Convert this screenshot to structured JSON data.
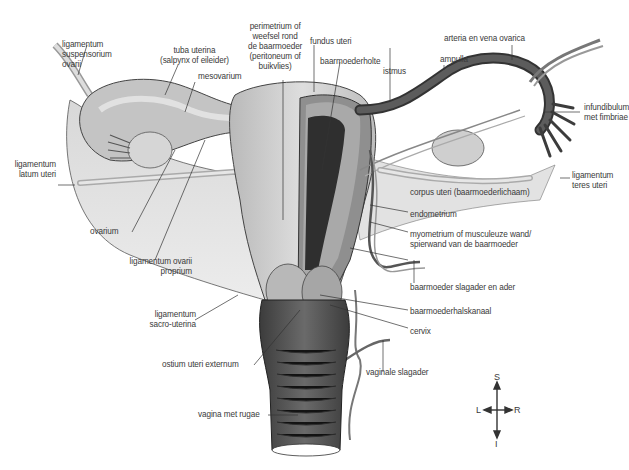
{
  "diagram": {
    "labels": {
      "lig_suspensorium": "ligamentum\nsuspensorium\novarii",
      "tuba_uterina": "tuba uterina\n(salpynx of eileider)",
      "mesovarium": "mesovarium",
      "perimetrium": "perimetrium of\nweefsel rond\nde baarmoeder\n(peritoneum of\nbuikvlies)",
      "fundus": "fundus uteri",
      "baarmoederholte": "baarmoederholte",
      "istmus": "istmus",
      "ampulla": "ampulla",
      "arteria_vena": "arteria en vena ovarica",
      "infundibulum": "infundibulum\nmet fimbriae",
      "lig_latum": "ligamentum\nlatum uteri",
      "lig_teres": "ligamentum\nteres uteri",
      "corpus_uteri": "corpus uteri (baarmoederlichaam)",
      "endometrium": "endometrium",
      "myometrium": "myometrium of musculeuze wand/\nspierwand van de baarmoeder",
      "ovarium": "ovarium",
      "lig_ovarii_proprium": "ligamentum ovarii\nproprium",
      "slagader_ader": "baarmoeder slagader en ader",
      "halskanaal": "baarmoederhalskanaal",
      "lig_sacro": "ligamentum\nsacro-uterina",
      "cervix": "cervix",
      "ostium": "ostium uteri externum",
      "vaginale_slagader": "vaginale slagader",
      "vagina": "vagina met rugae"
    },
    "compass": {
      "up": "S",
      "down": "I",
      "left": "L",
      "right": "R"
    },
    "colors": {
      "tissue_light": "#cfcfcf",
      "tissue_mid": "#9a9a9a",
      "tissue_dark": "#4a4a4a",
      "line": "#333333",
      "text": "#3a3a3a"
    }
  }
}
